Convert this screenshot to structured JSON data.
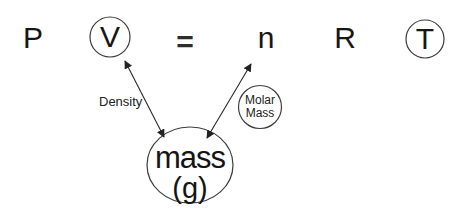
{
  "colors": {
    "background": "#ffffff",
    "ink": "#1a1a1a",
    "circle_stroke": "#3c3c3c"
  },
  "equation": {
    "pressure": "P",
    "volume": "V",
    "equals": "=",
    "moles": "n",
    "gas_constant": "R",
    "temperature": "T"
  },
  "annotations": {
    "density": "Density",
    "molar_mass_line1": "Molar",
    "molar_mass_line2": "Mass",
    "mass": "mass",
    "mass_units": "(g)"
  }
}
